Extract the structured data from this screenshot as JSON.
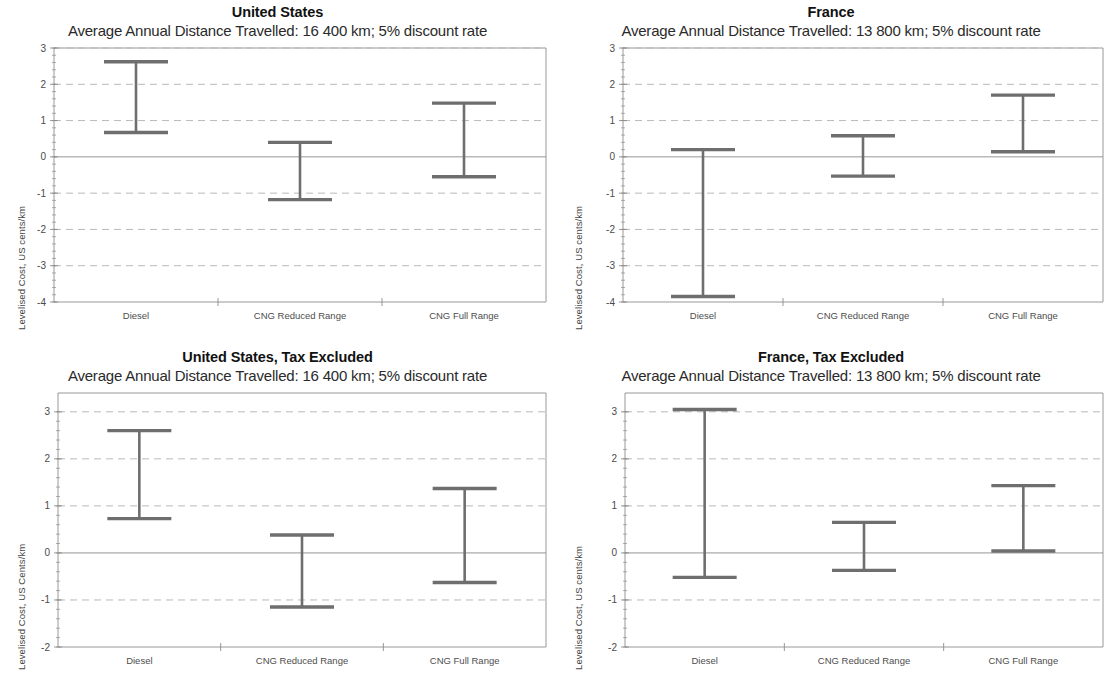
{
  "figure": {
    "panel_count": 4,
    "categories": [
      "Diesel",
      "CNG Reduced Range",
      "CNG Full Range"
    ]
  },
  "panels": [
    {
      "title": "United States",
      "subtitle": "Average Annual Distance Travelled: 16 400 km; 5% discount rate",
      "ylabel": "Levelised Cost, US cents/km"
    },
    {
      "title": "France",
      "subtitle": "Average Annual Distance Travelled: 13 800 km; 5% discount rate",
      "ylabel": "Levelised Cost, US cents/km"
    },
    {
      "title": "United States, Tax Excluded",
      "subtitle": "Average Annual Distance Travelled: 16 400 km; 5% discount rate",
      "ylabel": "Levelised Cost, US Cents/km"
    },
    {
      "title": "France, Tax Excluded",
      "subtitle": "Average Annual Distance Travelled: 13 800 km; 5% discount rate",
      "ylabel": "Levelised Cost, US cents/km"
    }
  ],
  "axis_ticks": {
    "top_row": [
      "3",
      "2",
      "1",
      "0",
      "-1",
      "-2",
      "-3",
      "-4"
    ],
    "bottom_row": [
      "3",
      "2",
      "1",
      "0",
      "-1",
      "-2"
    ]
  },
  "chart_data": [
    {
      "type": "bar",
      "title": "United States",
      "subtitle": "Average Annual Distance Travelled: 16 400 km; 5% discount rate",
      "xlabel": "",
      "ylabel": "Levelised Cost, US cents/km",
      "categories": [
        "Diesel",
        "CNG Reduced Range",
        "CNG Full Range"
      ],
      "ylim": [
        -4,
        3
      ],
      "yticks": [
        3,
        2,
        1,
        0,
        -1,
        -2,
        -3,
        -4
      ],
      "grid": true,
      "legend": "none",
      "series": [
        {
          "name": "high",
          "values": [
            2.62,
            0.4,
            1.48
          ]
        },
        {
          "name": "low",
          "values": [
            0.67,
            -1.18,
            -0.55
          ]
        }
      ]
    },
    {
      "type": "bar",
      "title": "France",
      "subtitle": "Average Annual Distance Travelled: 13 800 km; 5% discount rate",
      "xlabel": "",
      "ylabel": "Levelised Cost, US cents/km",
      "categories": [
        "Diesel",
        "CNG Reduced Range",
        "CNG Full Range"
      ],
      "ylim": [
        -4,
        3
      ],
      "yticks": [
        3,
        2,
        1,
        0,
        -1,
        -2,
        -3,
        -4
      ],
      "grid": true,
      "legend": "none",
      "series": [
        {
          "name": "high",
          "values": [
            0.2,
            0.58,
            1.7
          ]
        },
        {
          "name": "low",
          "values": [
            -3.85,
            -0.53,
            0.14
          ]
        }
      ]
    },
    {
      "type": "bar",
      "title": "United States, Tax Excluded",
      "subtitle": "Average Annual Distance Travelled: 16 400 km; 5% discount rate",
      "xlabel": "",
      "ylabel": "Levelised Cost, US Cents/km",
      "categories": [
        "Diesel",
        "CNG Reduced Range",
        "CNG Full Range"
      ],
      "ylim": [
        -2,
        3.4
      ],
      "yticks": [
        3,
        2,
        1,
        0,
        -1,
        -2
      ],
      "grid": true,
      "legend": "none",
      "series": [
        {
          "name": "high",
          "values": [
            2.6,
            0.38,
            1.37
          ]
        },
        {
          "name": "low",
          "values": [
            0.73,
            -1.15,
            -0.63
          ]
        }
      ]
    },
    {
      "type": "bar",
      "title": "France, Tax Excluded",
      "subtitle": "Average Annual Distance Travelled: 13 800 km; 5% discount rate",
      "xlabel": "",
      "ylabel": "Levelised Cost, US cents/km",
      "categories": [
        "Diesel",
        "CNG Reduced Range",
        "CNG Full Range"
      ],
      "ylim": [
        -2,
        3.4
      ],
      "yticks": [
        3,
        2,
        1,
        0,
        -1,
        -2
      ],
      "grid": true,
      "legend": "none",
      "series": [
        {
          "name": "high",
          "values": [
            3.05,
            0.65,
            1.43
          ]
        },
        {
          "name": "low",
          "values": [
            -0.52,
            -0.37,
            0.04
          ]
        }
      ]
    }
  ],
  "style": {
    "bar_color": "#6e6e6e",
    "grid_color": "#b9b9b9",
    "axis_color": "#8c8c8c",
    "zero_line_color": "#8a8a8a",
    "background": "#ffffff"
  }
}
